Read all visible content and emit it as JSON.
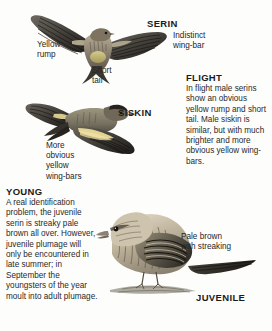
{
  "page": {
    "background_color": "#fdfdfc",
    "text_color": "#262626"
  },
  "labels": {
    "serin_heading": "SERIN",
    "siskin_heading": "SISKIN",
    "juvenile_heading": "JUVENILE",
    "yellow_rump": "Yellow\nrump",
    "short_tail": "Short\ntail",
    "indistinct_wing_bar": "Indistinct\nwing-bar",
    "more_obvious": "More\nobvious\nyellow\nwing-bars",
    "pale_brown": "Pale brown\nwith streaking"
  },
  "sections": {
    "flight": {
      "title": "FLIGHT",
      "body": "In flight male serins show an obvious yellow rump and short tail. Male siskin is similar, but with much brighter and more obvious yellow wing-bars."
    },
    "young": {
      "title": "YOUNG",
      "body": "A real identification problem, the juvenile serin is streaky pale brown all over. However, juvenile plumage will only be encountered in late summer; in September the youngsters of the year moult into adult plumage."
    }
  },
  "illustrations": [
    {
      "name": "serin-in-flight-from-below",
      "subject": "Serin",
      "view": "underside in flight"
    },
    {
      "name": "siskin-in-flight",
      "subject": "Siskin",
      "view": "side in flight"
    },
    {
      "name": "juvenile-serin-perched",
      "subject": "Juvenile Serin",
      "view": "perched side-on"
    }
  ]
}
